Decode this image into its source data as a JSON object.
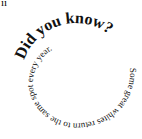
{
  "stray_text": "ıı",
  "spiral": {
    "line1": "Did you know?",
    "line2": "Some great whites return to the same spot every year.",
    "full": "Did you know? Some great whites return to the same spot every year."
  },
  "colors": {
    "text": "#111111",
    "background": "#ffffff"
  }
}
